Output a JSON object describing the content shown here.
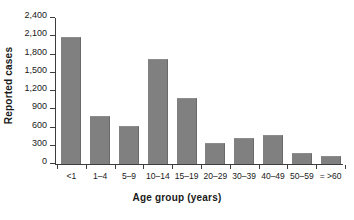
{
  "chart_data": {
    "type": "bar",
    "title": "",
    "xlabel": "Age group (years)",
    "ylabel": "Reported cases",
    "categories": [
      "<1",
      "1–4",
      "5–9",
      "10–14",
      "15–19",
      "20–29",
      "30–39",
      "40–49",
      "50–59",
      "= >60"
    ],
    "values": [
      2095,
      790,
      620,
      1730,
      1085,
      345,
      430,
      470,
      180,
      135
    ],
    "ylim": [
      0,
      2400
    ],
    "yticks": [
      0,
      300,
      600,
      900,
      1200,
      1500,
      1800,
      2100,
      2400
    ],
    "ytick_labels": [
      "0",
      "300",
      "600",
      "900",
      "1,200",
      "1,500",
      "1,800",
      "2,100",
      "2,400"
    ],
    "grid": false,
    "legend": false,
    "bar_color": "#808080",
    "axis_color": "#3d3d3d"
  }
}
